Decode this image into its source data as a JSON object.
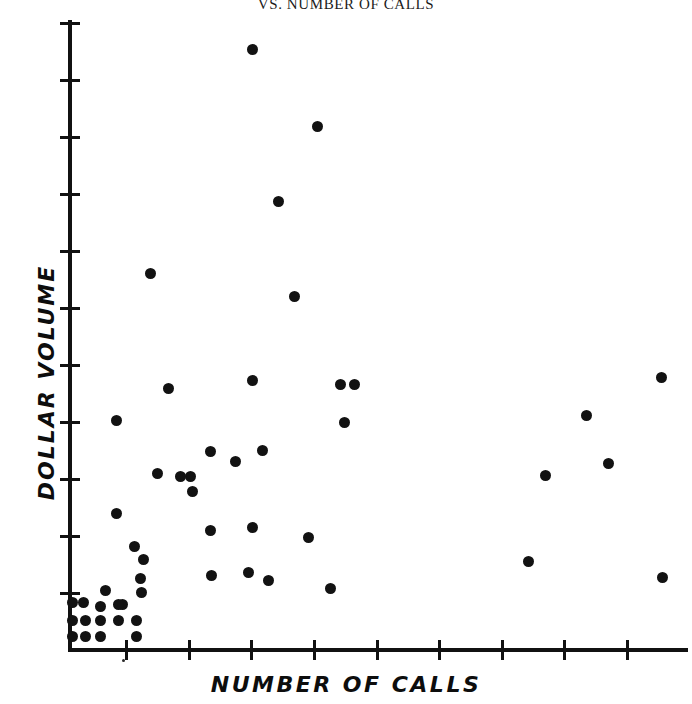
{
  "chart_data": {
    "type": "scatter",
    "title": "VS. NUMBER OF CALLS",
    "xlabel": "NUMBER OF CALLS",
    "ylabel": "DOLLAR VOLUME",
    "grid": false,
    "legend": null,
    "marker_color": "#121212",
    "axis_color": "#111111",
    "xlim": [
      0,
      10
    ],
    "ylim": [
      0,
      11
    ],
    "x_tick_count": 10,
    "y_tick_count": 11,
    "x_tick_labels": [],
    "y_tick_labels": [],
    "note": "Axes are unlabeled: ticks are evenly spaced with no numeric annotations.",
    "points_pixel": [
      [
        252,
        49
      ],
      [
        317,
        126
      ],
      [
        278,
        201
      ],
      [
        294,
        296
      ],
      [
        150,
        273
      ],
      [
        168,
        388
      ],
      [
        252,
        380
      ],
      [
        340,
        384
      ],
      [
        354,
        384
      ],
      [
        116,
        420
      ],
      [
        586,
        415
      ],
      [
        661,
        377
      ],
      [
        344,
        422
      ],
      [
        210,
        451
      ],
      [
        235,
        461
      ],
      [
        157,
        473
      ],
      [
        180,
        476
      ],
      [
        190,
        476
      ],
      [
        192,
        491
      ],
      [
        262,
        450
      ],
      [
        545,
        475
      ],
      [
        608,
        463
      ],
      [
        210,
        530
      ],
      [
        252,
        527
      ],
      [
        308,
        537
      ],
      [
        116,
        513
      ],
      [
        134,
        546
      ],
      [
        211,
        575
      ],
      [
        248,
        572
      ],
      [
        268,
        580
      ],
      [
        330,
        588
      ],
      [
        140,
        578
      ],
      [
        141,
        592
      ],
      [
        143,
        559
      ],
      [
        528,
        561
      ],
      [
        662,
        577
      ],
      [
        105,
        590
      ],
      [
        122,
        604
      ],
      [
        100,
        606
      ],
      [
        83,
        602
      ],
      [
        72,
        602
      ],
      [
        72,
        620
      ],
      [
        85,
        620
      ],
      [
        100,
        620
      ],
      [
        118,
        620
      ],
      [
        136,
        620
      ],
      [
        72,
        636
      ],
      [
        85,
        636
      ],
      [
        100,
        636
      ],
      [
        136,
        636
      ],
      [
        118,
        604
      ]
    ],
    "points_data": [
      {
        "x": 2.97,
        "y": 9.85
      },
      {
        "x": 4.02,
        "y": 8.52
      },
      {
        "x": 3.39,
        "y": 7.23
      },
      {
        "x": 3.65,
        "y": 5.59
      },
      {
        "x": 1.33,
        "y": 5.99
      },
      {
        "x": 1.62,
        "y": 4.0
      },
      {
        "x": 2.97,
        "y": 4.14
      },
      {
        "x": 4.39,
        "y": 4.07
      },
      {
        "x": 4.61,
        "y": 4.07
      },
      {
        "x": 0.78,
        "y": 3.45
      },
      {
        "x": 8.3,
        "y": 3.54
      },
      {
        "x": 9.5,
        "y": 4.19
      },
      {
        "x": 4.45,
        "y": 3.4
      },
      {
        "x": 2.29,
        "y": 2.9
      },
      {
        "x": 2.69,
        "y": 2.73
      },
      {
        "x": 1.43,
        "y": 2.52
      },
      {
        "x": 1.8,
        "y": 2.47
      },
      {
        "x": 1.96,
        "y": 2.47
      },
      {
        "x": 1.99,
        "y": 2.21
      },
      {
        "x": 3.13,
        "y": 2.94
      },
      {
        "x": 7.64,
        "y": 2.52
      },
      {
        "x": 8.65,
        "y": 2.73
      },
      {
        "x": 2.29,
        "y": 2.04
      },
      {
        "x": 2.97,
        "y": 2.09
      },
      {
        "x": 3.86,
        "y": 1.92
      },
      {
        "x": 0.78,
        "y": 2.33
      },
      {
        "x": 1.07,
        "y": 1.76
      },
      {
        "x": 2.31,
        "y": 1.26
      },
      {
        "x": 2.91,
        "y": 1.31
      },
      {
        "x": 3.23,
        "y": 1.17
      },
      {
        "x": 4.22,
        "y": 1.03
      },
      {
        "x": 1.17,
        "y": 1.2
      },
      {
        "x": 1.18,
        "y": 0.96
      },
      {
        "x": 1.21,
        "y": 1.53
      },
      {
        "x": 7.37,
        "y": 1.5
      },
      {
        "x": 9.52,
        "y": 0.91
      },
      {
        "x": 0.6,
        "y": 1.03
      },
      {
        "x": 0.87,
        "y": 0.79
      },
      {
        "x": 0.52,
        "y": 0.76
      },
      {
        "x": 0.24,
        "y": 0.83
      },
      {
        "x": 0.06,
        "y": 0.83
      },
      {
        "x": 0.06,
        "y": 0.52
      },
      {
        "x": 0.27,
        "y": 0.52
      },
      {
        "x": 0.52,
        "y": 0.52
      },
      {
        "x": 0.81,
        "y": 0.52
      },
      {
        "x": 1.1,
        "y": 0.52
      },
      {
        "x": 0.06,
        "y": 0.24
      },
      {
        "x": 0.27,
        "y": 0.24
      },
      {
        "x": 0.52,
        "y": 0.24
      },
      {
        "x": 1.1,
        "y": 0.24
      },
      {
        "x": 0.81,
        "y": 0.79
      }
    ],
    "n_points": 51,
    "specks_pixel": [
      [
        123,
        660
      ]
    ]
  },
  "axes": {
    "y_ticks_pixel": [
      22,
      79,
      136,
      193,
      250,
      307,
      364,
      421,
      478,
      535,
      592
    ],
    "x_ticks_pixel": [
      125,
      188,
      250,
      313,
      376,
      438,
      501,
      563,
      626
    ]
  }
}
